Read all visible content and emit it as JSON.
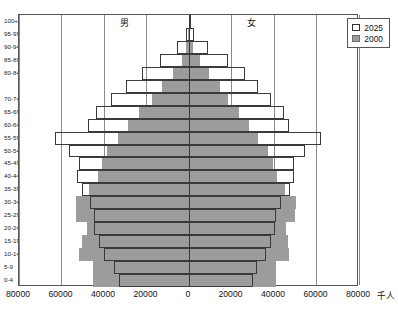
{
  "chart_data": {
    "type": "bar",
    "subtype": "population-pyramid",
    "title": "",
    "xlabel": "千人",
    "ylabel": "",
    "unit": "千人",
    "grid": true,
    "legend_position": "top-right",
    "xlim": [
      -80000,
      80000
    ],
    "xticks": [
      -80000,
      -60000,
      -40000,
      -20000,
      0,
      20000,
      40000,
      60000,
      80000
    ],
    "xtick_labels": [
      "80000",
      "60000",
      "40000",
      "20000",
      "0",
      "20000",
      "40000",
      "60000",
      "80000"
    ],
    "side_labels": {
      "left": "男",
      "right": "女"
    },
    "categories": [
      "0-4",
      "5-9",
      "10-14",
      "15-19",
      "20-24",
      "25-29",
      "30-34",
      "35-39",
      "40-44",
      "45-49",
      "50-54",
      "55-59",
      "60-64",
      "65-69",
      "70-74",
      "75-79",
      "80-84",
      "85-89",
      "90-94",
      "95-99",
      "100+"
    ],
    "axis_tick_labels": [
      "0-4",
      "5-9",
      "10-14",
      "15-19",
      "20-24",
      "25-29",
      "30-34",
      "35-39",
      "40-44",
      "45-49",
      "50-54",
      "55-59",
      "60-64",
      "65-69",
      "70-74",
      "",
      "80-84",
      "85-89",
      "90-94",
      "95-99",
      "100+"
    ],
    "series": [
      {
        "name": "2000",
        "color": "#9c9c9c",
        "style": "filled",
        "male": [
          45000,
          45000,
          52000,
          50500,
          48000,
          53000,
          53000,
          47000,
          43000,
          41000,
          38500,
          33500,
          28500,
          23500,
          17500,
          12500,
          7500,
          3500,
          1200,
          250,
          40
        ],
        "female": [
          41000,
          41000,
          47000,
          46500,
          45500,
          50000,
          50500,
          45000,
          41500,
          39500,
          37000,
          32500,
          28000,
          23500,
          18500,
          14500,
          9500,
          5000,
          1900,
          450,
          80
        ]
      },
      {
        "name": "2025",
        "color": "#ffffff",
        "style": "outlined",
        "male": [
          33000,
          35500,
          40000,
          42500,
          44500,
          44500,
          46500,
          50500,
          52500,
          52000,
          56500,
          63000,
          47500,
          44000,
          36500,
          29500,
          22000,
          13500,
          5500,
          1200,
          150
        ],
        "female": [
          30000,
          32000,
          36000,
          38500,
          40500,
          41000,
          43500,
          47500,
          49500,
          49500,
          54500,
          62000,
          47000,
          44500,
          38500,
          32500,
          26500,
          18500,
          9000,
          2500,
          400
        ]
      }
    ]
  },
  "legend": {
    "items": [
      {
        "label": "2025",
        "swatch": "outlined"
      },
      {
        "label": "2000",
        "swatch": "filled"
      }
    ]
  },
  "colors": {
    "fill_2000": "#9c9c9c",
    "stroke_2025": "#3a3a3a",
    "grid": "#8a8a8a",
    "axis": "#333333",
    "frame": "#555555",
    "background": "#ffffff"
  }
}
